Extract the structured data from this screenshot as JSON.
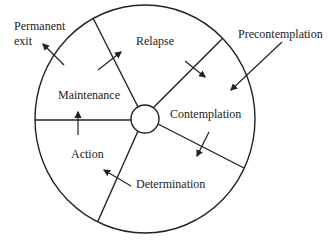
{
  "diagram": {
    "stroke_color": "#222222",
    "background": "#ffffff",
    "stages": [
      {
        "label": "Relapse"
      },
      {
        "label": "Contemplation"
      },
      {
        "label": "Determination"
      },
      {
        "label": "Action"
      },
      {
        "label": "Maintenance"
      }
    ],
    "external_labels": {
      "entry": "Precontemplation",
      "exit_line1": "Permanent",
      "exit_line2": "exit"
    }
  }
}
